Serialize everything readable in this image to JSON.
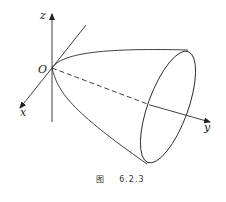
{
  "figure": {
    "caption_prefix": "图",
    "caption_number": "6.2.3",
    "axes": {
      "x_label": "x",
      "y_label": "y",
      "z_label": "z",
      "origin_label": "O"
    },
    "stroke_color": "#2a2a2a",
    "surface": "elliptic paraboloid opening along y-axis"
  }
}
